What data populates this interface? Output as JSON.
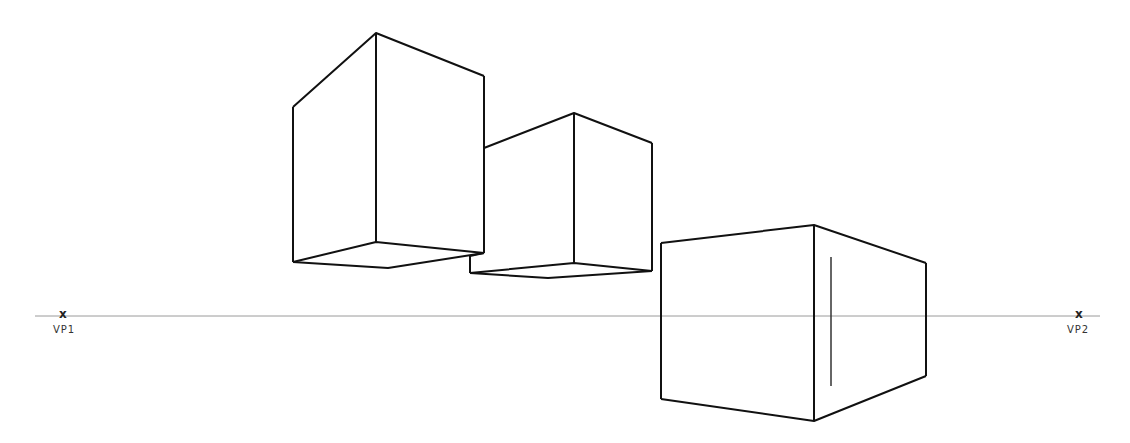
{
  "diagram": {
    "type": "two-point-perspective",
    "horizon_y": 316,
    "horizon_color": "#9a9a9a",
    "stroke_color": "#111111",
    "vanishing_points": [
      {
        "label": "VP1",
        "marker": "x",
        "x": 64,
        "y": 316
      },
      {
        "label": "VP2",
        "marker": "x",
        "x": 1079,
        "y": 316
      }
    ],
    "boxes": [
      {
        "name": "box-above-horizon-left",
        "position": "above horizon, viewed from below"
      },
      {
        "name": "box-above-horizon-middle",
        "position": "above horizon, viewed from below"
      },
      {
        "name": "box-on-horizon-right",
        "position": "straddling horizon line"
      }
    ]
  }
}
